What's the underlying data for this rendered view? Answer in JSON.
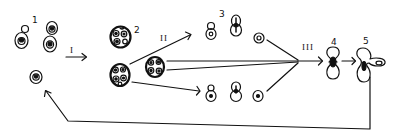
{
  "diagram": {
    "type": "life-cycle",
    "stroke_color": "#111111",
    "background": "#ffffff",
    "stage_labels": {
      "s1": "1",
      "s2": "2",
      "s3": "3",
      "s4": "4",
      "s5": "5"
    },
    "transition_labels": {
      "t1": "I",
      "t2": "II",
      "t3": "III"
    },
    "nodes": [
      {
        "id": "stage-1",
        "label": "1",
        "description": "single cells and budding cells"
      },
      {
        "id": "stage-2",
        "label": "2",
        "description": "multicellular clusters"
      },
      {
        "id": "stage-3",
        "label": "3",
        "description": "budding cell pairs (upper and lower rows)"
      },
      {
        "id": "stage-4",
        "label": "4",
        "description": "dumbbell-shaped fused cell"
      },
      {
        "id": "stage-5",
        "label": "5",
        "description": "dumbbell with projecting bud"
      }
    ],
    "edges": [
      {
        "from": "stage-1",
        "to": "stage-2",
        "label": "I"
      },
      {
        "from": "stage-2",
        "to": "stage-3",
        "label": "II"
      },
      {
        "from": "stage-3",
        "to": "stage-4",
        "label": "III"
      },
      {
        "from": "stage-4",
        "to": "stage-5",
        "label": ""
      },
      {
        "from": "stage-5",
        "to": "stage-1",
        "label": ""
      }
    ]
  }
}
